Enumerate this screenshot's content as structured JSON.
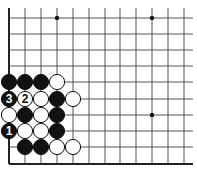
{
  "diagram": {
    "type": "go-board-corner",
    "grid": {
      "columns_x": [
        9,
        25,
        41,
        57,
        73,
        89,
        105,
        120,
        136,
        152,
        168,
        184
      ],
      "rows_y": [
        18,
        34,
        50,
        66,
        82,
        99,
        115,
        131,
        147,
        164
      ],
      "right_extent": 193,
      "top_extent": 8,
      "left_edge": true,
      "bottom_edge": true,
      "line_color": "#555555",
      "edge_color": "#222222"
    },
    "star_points": [
      {
        "col": 3,
        "row": 0
      },
      {
        "col": 9,
        "row": 0
      },
      {
        "col": 9,
        "row": 6
      }
    ],
    "stones": [
      {
        "col": 0,
        "row": 4,
        "color": "black",
        "label": ""
      },
      {
        "col": 1,
        "row": 4,
        "color": "black",
        "label": ""
      },
      {
        "col": 2,
        "row": 4,
        "color": "black",
        "label": ""
      },
      {
        "col": 3,
        "row": 4,
        "color": "white",
        "label": ""
      },
      {
        "col": 0,
        "row": 5,
        "color": "black",
        "label": "3"
      },
      {
        "col": 1,
        "row": 5,
        "color": "white",
        "label": "2"
      },
      {
        "col": 2,
        "row": 5,
        "color": "white",
        "label": ""
      },
      {
        "col": 3,
        "row": 5,
        "color": "black",
        "label": ""
      },
      {
        "col": 4,
        "row": 5,
        "color": "white",
        "label": ""
      },
      {
        "col": 0,
        "row": 6,
        "color": "white",
        "label": ""
      },
      {
        "col": 1,
        "row": 6,
        "color": "black",
        "label": ""
      },
      {
        "col": 2,
        "row": 6,
        "color": "white",
        "label": ""
      },
      {
        "col": 3,
        "row": 6,
        "color": "black",
        "label": ""
      },
      {
        "col": 0,
        "row": 7,
        "color": "black",
        "label": "1"
      },
      {
        "col": 1,
        "row": 7,
        "color": "white",
        "label": ""
      },
      {
        "col": 2,
        "row": 7,
        "color": "white",
        "label": ""
      },
      {
        "col": 3,
        "row": 7,
        "color": "black",
        "label": ""
      },
      {
        "col": 1,
        "row": 8,
        "color": "black",
        "label": ""
      },
      {
        "col": 2,
        "row": 8,
        "color": "black",
        "label": ""
      },
      {
        "col": 3,
        "row": 8,
        "color": "white",
        "label": ""
      },
      {
        "col": 4,
        "row": 8,
        "color": "white",
        "label": ""
      }
    ],
    "move_labels": [
      "1",
      "2",
      "3"
    ]
  }
}
